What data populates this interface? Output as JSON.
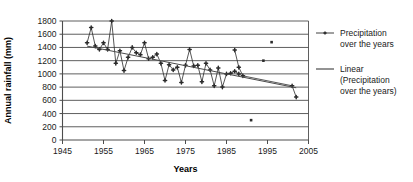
{
  "chart_data": {
    "type": "line",
    "title": "",
    "xlabel": "Years",
    "ylabel": "Annual rainfall (mm)",
    "xlim": [
      1945,
      2005
    ],
    "ylim": [
      0,
      1800
    ],
    "xticks": [
      1945,
      1955,
      1965,
      1975,
      1985,
      1995,
      2005
    ],
    "yticks": [
      0,
      200,
      400,
      600,
      800,
      1000,
      1200,
      1400,
      1600,
      1800
    ],
    "grid": "horizontal",
    "legend_position": "right",
    "series": [
      {
        "name": "Precipitation over the years",
        "type": "line-markers",
        "color": "#2b2b2b",
        "x": [
          1951,
          1952,
          1953,
          1954,
          1955,
          1956,
          1957,
          1958,
          1959,
          1960,
          1961,
          1962,
          1963,
          1964,
          1965,
          1966,
          1967,
          1968,
          1969,
          1970,
          1971,
          1972,
          1973,
          1974,
          1975,
          1976,
          1977,
          1978,
          1979,
          1980,
          1981,
          1982,
          1983,
          1984,
          1985,
          1986,
          1987,
          1988
        ],
        "values": [
          1470,
          1700,
          1420,
          1370,
          1470,
          1370,
          1800,
          1160,
          1350,
          1050,
          1250,
          1400,
          1320,
          1290,
          1470,
          1230,
          1250,
          1300,
          1160,
          900,
          1140,
          1060,
          1100,
          870,
          1130,
          1370,
          1120,
          1130,
          880,
          1160,
          1060,
          820,
          1090,
          800,
          1000,
          1010,
          1040,
          1000
        ]
      },
      {
        "name": "Precipitation over the years (later segment)",
        "type": "line-markers",
        "color": "#2b2b2b",
        "x": [
          1987,
          1988,
          1989,
          2001,
          2002
        ],
        "values": [
          1360,
          1100,
          970,
          820,
          650
        ]
      },
      {
        "name": "Precipitation over the years (isolated points)",
        "type": "scatter",
        "color": "#2b2b2b",
        "x": [
          1991,
          1994,
          1996
        ],
        "values": [
          300,
          1200,
          1480
        ]
      },
      {
        "name": "Linear (Precipitation over the years)",
        "type": "trendline",
        "color": "#4a4a4a",
        "x": [
          1951,
          2002
        ],
        "values": [
          1420,
          790
        ]
      }
    ]
  },
  "legend": {
    "items": [
      {
        "marker": "line-with-point",
        "lines": [
          "Precipitation",
          "over the years"
        ]
      },
      {
        "marker": "line",
        "lines": [
          "Linear",
          "(Precipitation",
          "over the years)"
        ]
      }
    ]
  },
  "colors": {
    "ink": "#1a1a1a",
    "gridline": "#4d4d4d",
    "series": "#2b2b2b",
    "trend": "#4a4a4a",
    "background": "#ffffff"
  }
}
